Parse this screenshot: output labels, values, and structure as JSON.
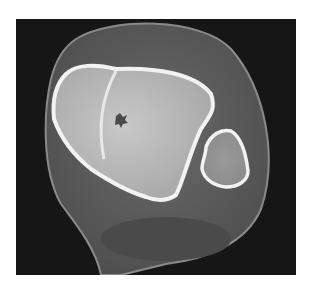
{
  "image": {
    "kind": "axial CT scan slice",
    "colors": {
      "background": "#ffffff",
      "panel": "#161616",
      "soft_tissue": "#5a5a5a",
      "bone_cortex": "#f2f2f2",
      "bone_marrow": "#bdbdbd"
    }
  }
}
